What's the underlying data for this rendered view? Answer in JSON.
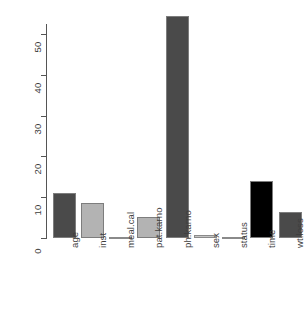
{
  "chart_data": {
    "type": "bar",
    "title": "",
    "subtitle": "",
    "xlabel": "",
    "ylabel": "",
    "categories": [
      "age",
      "inst",
      "meal.cal",
      "pat.karno",
      "ph.karno",
      "sex",
      "status",
      "time",
      "wt.loss"
    ],
    "values": [
      11,
      8.6,
      0.1,
      5.1,
      54.5,
      0.8,
      0.05,
      14,
      6.4
    ],
    "bar_colors": [
      "#4a4a4a",
      "#b3b3b3",
      "#b3b3b3",
      "#b3b3b3",
      "#4a4a4a",
      "#c4c4c4",
      "#b3b3b3",
      "#000000",
      "#4a4a4a"
    ],
    "ylim": [
      0,
      56
    ],
    "yticks": [
      0,
      10,
      20,
      30,
      40,
      50
    ],
    "ytick_labels": [
      "0",
      "10",
      "20",
      "30",
      "40",
      "50"
    ],
    "grid": false,
    "legend": null,
    "annotations": []
  },
  "axes": {
    "y_axis_name": "y-axis",
    "x_axis_name": "x-axis"
  },
  "style": {
    "background": "#ffffff",
    "axis_color": "#555555",
    "text_color": "#3d3d3d",
    "bar_border": "#7d7d7d"
  }
}
